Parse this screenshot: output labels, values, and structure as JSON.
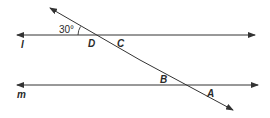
{
  "diagram": {
    "type": "parallel lines cut by a transversal",
    "lines": {
      "l": {
        "label": "l",
        "y": 35,
        "x1": 255,
        "x2": 17,
        "arrows": "both"
      },
      "m": {
        "label": "m",
        "y": 85,
        "x1": 258,
        "x2": 17,
        "arrows": "both"
      },
      "transversal": {
        "x1": 233,
        "y1": 110,
        "x2": 50,
        "y2": 8,
        "arrows": "both"
      }
    },
    "angle": {
      "value": "30°",
      "position": "between transversal and line l, upper-left of D"
    },
    "points": {
      "D": "D",
      "C": "C",
      "B": "B",
      "A": "A"
    },
    "colors": {
      "stroke": "#333333",
      "text": "#2a2a2a",
      "background": "#ffffff"
    }
  }
}
